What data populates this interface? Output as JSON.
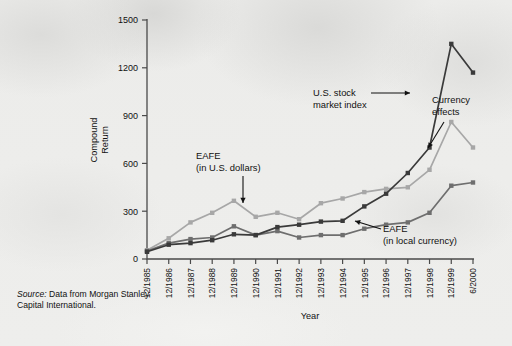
{
  "figure": {
    "source_note_italic": "Source:",
    "source_note_rest": " Data from Morgan Stanley Capital International."
  },
  "annotations": {
    "eafe_usd_line1": "EAFE",
    "eafe_usd_line2": "(in U.S. dollars)",
    "us_stock_line1": "U.S. stock",
    "us_stock_line2": "market index",
    "currency_line1": "Currency",
    "currency_line2": "effects",
    "eafe_local_line1": "EAFE",
    "eafe_local_line2": "(in local currency)"
  },
  "chart_data": {
    "type": "line",
    "title": "",
    "xlabel": "Year",
    "ylabel": "Compound Return",
    "ylim": [
      0,
      1500
    ],
    "yticks": [
      0,
      300,
      600,
      900,
      1200,
      1500
    ],
    "grid": false,
    "legend": "annotations-inline",
    "categories": [
      "12/1985",
      "12/1986",
      "12/1987",
      "12/1988",
      "12/1989",
      "12/1990",
      "12/1991",
      "12/1992",
      "12/1993",
      "12/1994",
      "12/1995",
      "12/1996",
      "12/1997",
      "12/1998",
      "12/1999",
      "6/2000"
    ],
    "series": [
      {
        "name": "EAFE (in U.S. dollars)",
        "color": "#a7a7a7",
        "values": [
          55,
          130,
          230,
          290,
          365,
          265,
          290,
          250,
          350,
          380,
          420,
          440,
          450,
          560,
          860,
          700
        ]
      },
      {
        "name": "EAFE (in local currency)",
        "color": "#6e6e6e",
        "values": [
          50,
          100,
          125,
          135,
          205,
          150,
          175,
          135,
          150,
          150,
          190,
          215,
          230,
          290,
          460,
          480
        ]
      },
      {
        "name": "U.S. stock market index",
        "color": "#3a3a3a",
        "values": [
          45,
          90,
          100,
          118,
          155,
          150,
          200,
          215,
          235,
          240,
          330,
          410,
          540,
          700,
          1350,
          1170
        ]
      }
    ]
  }
}
